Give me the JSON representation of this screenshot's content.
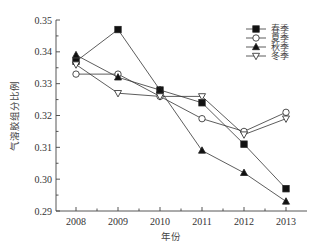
{
  "chart_data": {
    "type": "line",
    "title": "",
    "xlabel": "年份",
    "ylabel": "气溶胶组分比例",
    "x": [
      2008,
      2009,
      2010,
      2011,
      2012,
      2013
    ],
    "x_tick_labels": [
      "2008",
      "2009",
      "2010",
      "2011",
      "2012",
      "2013"
    ],
    "y_ticks": [
      0.29,
      0.3,
      0.31,
      0.32,
      0.33,
      0.34,
      0.35
    ],
    "y_tick_labels": [
      "0.29",
      "0.30",
      "0.31",
      "0.32",
      "0.33",
      "0.34",
      "0.35"
    ],
    "ylim": [
      0.29,
      0.35
    ],
    "xlim": [
      2007.5,
      2013.5
    ],
    "grid": false,
    "legend_position": "upper right",
    "series": [
      {
        "name": "春季",
        "marker": "square-filled",
        "values": [
          0.337,
          0.347,
          0.328,
          0.324,
          0.311,
          0.297
        ]
      },
      {
        "name": "夏季",
        "marker": "circle-open",
        "values": [
          0.333,
          0.333,
          0.326,
          0.319,
          0.315,
          0.321
        ]
      },
      {
        "name": "秋季",
        "marker": "triangle-up-filled",
        "values": [
          0.339,
          0.332,
          0.328,
          0.309,
          0.302,
          0.293
        ]
      },
      {
        "name": "冬季",
        "marker": "triangle-down-open",
        "values": [
          0.336,
          0.327,
          0.326,
          0.326,
          0.314,
          0.319
        ]
      }
    ]
  },
  "colors": {
    "line": "#333333",
    "axis": "#444444",
    "marker_fill": "#111111",
    "background": "#ffffff"
  }
}
